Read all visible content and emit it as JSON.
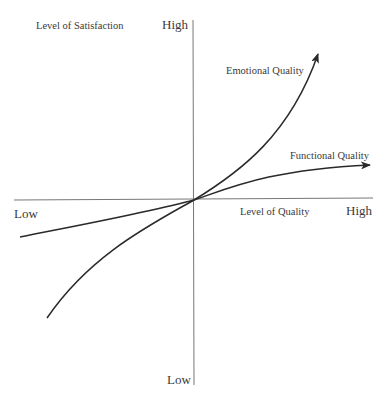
{
  "diagram": {
    "type": "quadrant-curve-diagram",
    "y_axis": {
      "title": "Level of Satisfaction",
      "high_label": "High",
      "low_label": "Low"
    },
    "x_axis": {
      "title": "Level of Quality",
      "high_label": "High",
      "low_label": "Low"
    },
    "curves": [
      {
        "name": "Emotional Quality",
        "shape": "exponential, accelerating upward",
        "color": "#333333"
      },
      {
        "name": "Functional Quality",
        "shape": "logarithmic, leveling off",
        "color": "#333333"
      }
    ],
    "axis_color": "#666666"
  }
}
